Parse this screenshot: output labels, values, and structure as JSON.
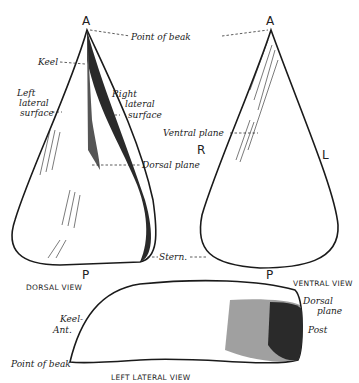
{
  "figure": {
    "vertex_labels": {
      "dorsal_top": "A",
      "ventral_top": "A",
      "dorsal_bottom": "P",
      "ventral_bottom": "P",
      "right": "R",
      "left": "L"
    },
    "labels": {
      "point_of_beak": "Point of beak",
      "keel": "Keel",
      "left_lateral_surface": [
        "Left",
        "lateral",
        "surface"
      ],
      "right_lateral_surface": [
        "Right",
        "lateral",
        "surface"
      ],
      "ventral_plane": "Ventral plane",
      "dorsal_plane": "Dorsal plane",
      "stern": "Stern.",
      "keel_lateral": "Keel-",
      "ant": "Ant.",
      "point_of_beak_lateral": "Point of beak",
      "dorsal_plane_lateral": [
        "Dorsal",
        "plane"
      ],
      "post": "Post"
    },
    "captions": {
      "dorsal_view": "DORSAL VIEW",
      "ventral_view": "VENTRAL VIEW",
      "left_lateral_view": "LEFT LATERAL VIEW"
    }
  }
}
